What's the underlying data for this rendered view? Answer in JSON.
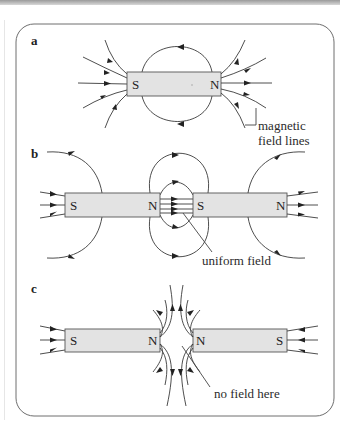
{
  "figure": {
    "frame_color": "#6e6e6e",
    "magnet_fill": "#e3e3e3",
    "line_color": "#3a3a3a",
    "panels": [
      {
        "label": "a",
        "magnets": [
          {
            "left_pole": "S",
            "right_pole": "N"
          }
        ],
        "annotation": {
          "line1": "magnetic",
          "line2": "field lines"
        }
      },
      {
        "label": "b",
        "magnets": [
          {
            "left_pole": "S",
            "right_pole": "N"
          },
          {
            "left_pole": "S",
            "right_pole": "N"
          }
        ],
        "annotation": {
          "line1": "uniform field"
        }
      },
      {
        "label": "c",
        "magnets": [
          {
            "left_pole": "S",
            "right_pole": "N"
          },
          {
            "left_pole": "N",
            "right_pole": "S"
          }
        ],
        "annotation": {
          "line1": "no field here"
        }
      }
    ]
  }
}
